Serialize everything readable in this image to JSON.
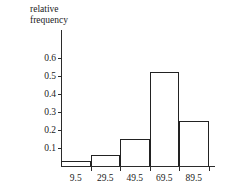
{
  "chart_data": {
    "type": "bar",
    "title": "",
    "subtitle": "",
    "ylabel": "relative\nfrequency",
    "xlabel": "",
    "categories": [
      "9.5",
      "29.5",
      "49.5",
      "69.5",
      "89.5"
    ],
    "values": [
      0.03,
      0.06,
      0.15,
      0.52,
      0.25
    ],
    "series": [
      {
        "name": "relative frequency",
        "values": [
          0.03,
          0.06,
          0.15,
          0.52,
          0.25
        ]
      }
    ],
    "ylim": [
      0,
      0.65
    ],
    "ytick_labels": [
      "0.6",
      "0.5",
      "0.4",
      "0.3",
      "0.2",
      "0.1"
    ],
    "ytick_values": [
      0.6,
      0.5,
      0.4,
      0.3,
      0.2,
      0.1
    ],
    "xtick_labels": [
      "9.5",
      "29.5",
      "49.5",
      "69.5",
      "89.5"
    ],
    "grid": false,
    "legend": false,
    "legend_position": "none",
    "bar_fill_color": "#ffffff",
    "bar_edge_color": "#222222",
    "axis_color": "#2b2b2b",
    "background_color": "#ffffff",
    "text_color": "#1a1a1a",
    "annotations": []
  }
}
